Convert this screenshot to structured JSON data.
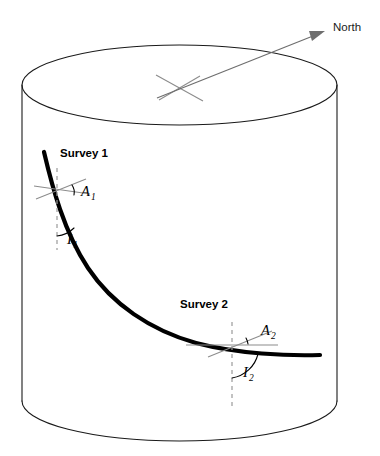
{
  "figure": {
    "title_text": "",
    "background_color": "#ffffff",
    "line_color": "#1a1a1a",
    "wellpath_color": "#000000",
    "reference_color": "#8c8c8c",
    "north_color": "#6e6e6e",
    "dashed_color": "#9a9a9a"
  },
  "labels": {
    "north": "North",
    "survey_1": "Survey 1",
    "survey_2": "Survey 2",
    "azimuth_1": "A",
    "azimuth_1_sub": "1",
    "inclination_1": "I",
    "inclination_1_sub": "1",
    "azimuth_2": "A",
    "azimuth_2_sub": "2",
    "inclination_2": "I",
    "inclination_2_sub": "2"
  }
}
